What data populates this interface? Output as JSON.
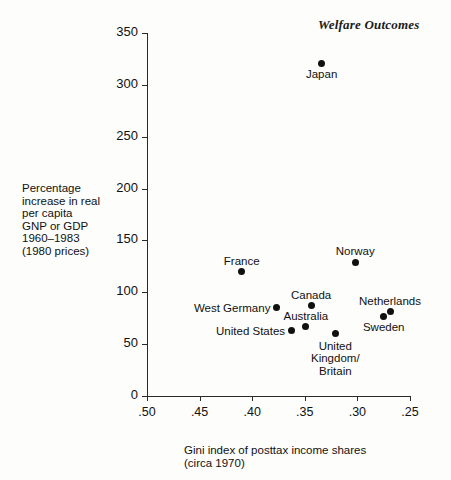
{
  "chart_data": {
    "type": "scatter",
    "title": "Welfare Outcomes",
    "xlabel": "Gini index of posttax income shares\n(circa 1970)",
    "ylabel": "Percentage\nincrease in real\nper capita\nGNP or GDP\n1960–1983\n(1980 prices)",
    "xlim": [
      0.5,
      0.25
    ],
    "ylim": [
      0,
      350
    ],
    "x_reversed": true,
    "grid": false,
    "legend": "none",
    "xticks": [
      ".50",
      ".45",
      ".40",
      ".35",
      ".30",
      ".25"
    ],
    "xtick_values": [
      0.5,
      0.45,
      0.4,
      0.35,
      0.3,
      0.25
    ],
    "yticks": [
      "0",
      "50",
      "100",
      "150",
      "200",
      "250",
      "300",
      "350"
    ],
    "ytick_values": [
      0,
      50,
      100,
      150,
      200,
      250,
      300,
      350
    ],
    "points": [
      {
        "label": "Japan",
        "x": 0.334,
        "y": 321,
        "label_pos": "below"
      },
      {
        "label": "Norway",
        "x": 0.302,
        "y": 129,
        "label_pos": "above"
      },
      {
        "label": "France",
        "x": 0.41,
        "y": 120,
        "label_pos": "above"
      },
      {
        "label": "Canada",
        "x": 0.344,
        "y": 87,
        "label_pos": "above"
      },
      {
        "label": "West Germany",
        "x": 0.377,
        "y": 85,
        "label_pos": "left"
      },
      {
        "label": "Netherlands",
        "x": 0.269,
        "y": 81,
        "label_pos": "above"
      },
      {
        "label": "Sweden",
        "x": 0.275,
        "y": 77,
        "label_pos": "below"
      },
      {
        "label": "Australia",
        "x": 0.349,
        "y": 67,
        "label_pos": "above"
      },
      {
        "label": "United States",
        "x": 0.363,
        "y": 63,
        "label_pos": "left"
      },
      {
        "label": "United Kingdom/\nBritain",
        "x": 0.321,
        "y": 60,
        "label_pos": "below2"
      }
    ],
    "colors": {
      "marker": "#111111",
      "axis": "#2a2a2a",
      "text": "#111111",
      "background": "#fdfdfc"
    }
  }
}
